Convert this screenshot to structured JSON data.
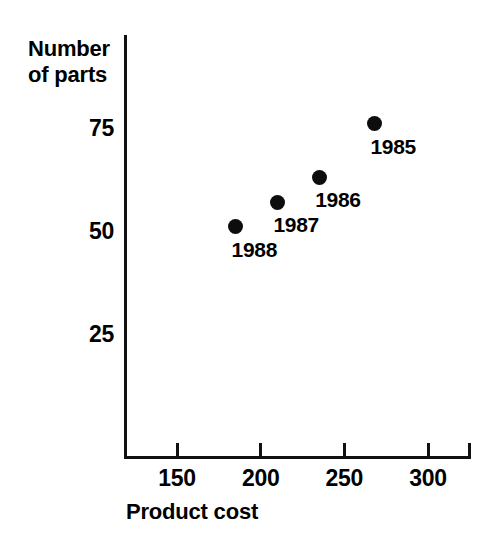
{
  "chart_data": {
    "type": "scatter",
    "title": "",
    "xlabel": "Product cost",
    "ylabel": "Number of parts",
    "ylabel_lines": [
      "Number",
      "of parts"
    ],
    "xlim": [
      125,
      330
    ],
    "ylim": [
      0,
      85
    ],
    "grid": false,
    "legend": "none",
    "xticks": [
      150,
      200,
      250,
      300
    ],
    "xtick_labels": [
      "150",
      "200",
      "250",
      "300"
    ],
    "yticks": [
      25,
      50,
      75
    ],
    "ytick_labels": [
      "25",
      "50",
      "75"
    ],
    "point_color": "#0d0d0d",
    "axis_color": "#111111",
    "background": "#ffffff",
    "points": [
      {
        "label": "1988",
        "x": 185,
        "y": 51
      },
      {
        "label": "1987",
        "x": 210,
        "y": 57
      },
      {
        "label": "1986",
        "x": 235,
        "y": 63
      },
      {
        "label": "1985",
        "x": 268,
        "y": 76
      }
    ]
  }
}
